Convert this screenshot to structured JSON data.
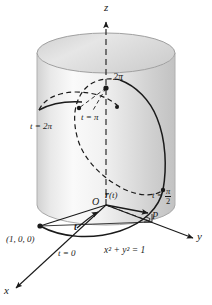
{
  "figure": {
    "surface_equation": "x² + y² = 1",
    "colors": {
      "ink": "#1a1a1a",
      "cylinder_light": "#fbfbfb",
      "cylinder_mid": "#e4e4e4",
      "cylinder_dark": "#c9c9c9",
      "cylinder_edge": "#9a9a9a",
      "cap_fill": "#dcdcdc"
    }
  },
  "axes": {
    "z_label": "z",
    "y_label": "y",
    "x_label": "x",
    "origin_label": "O"
  },
  "marks": {
    "z_tick_label": "2π",
    "point_label": "P",
    "start_point_coords": "(1, 0, 0)",
    "position_vector_label_r": "r",
    "position_vector_label_arg": "(t)",
    "tangent_vector_label": "t"
  },
  "parameter_labels": [
    {
      "id": "t0",
      "text": "t = 0"
    },
    {
      "id": "t_half",
      "lhs": "t =",
      "num": "π",
      "den": "2"
    },
    {
      "id": "t_pi",
      "text": "t = π"
    },
    {
      "id": "t_2pi",
      "text": "t = 2π"
    }
  ],
  "equation": {
    "text": "x² + y² = 1"
  }
}
